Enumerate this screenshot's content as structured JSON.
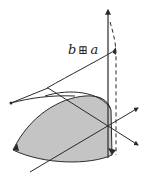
{
  "diagram": {
    "label": {
      "left": "b",
      "operator": "⊞",
      "right": "a"
    },
    "colors": {
      "stroke": "#2a2a2a",
      "fill": "#c4c4c4",
      "background": "#ffffff"
    }
  }
}
